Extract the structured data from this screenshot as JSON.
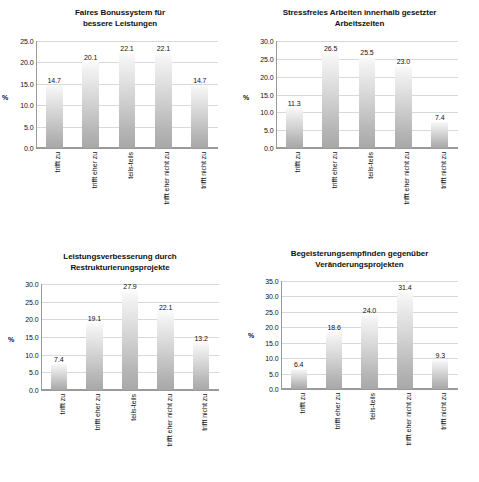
{
  "page": {
    "unit_label": "%"
  },
  "chart_data": [
    {
      "id": "faires-bonussystem",
      "type": "bar",
      "title": "Faires Bonussystem für bessere Leistungen",
      "title_lines": [
        "Faires Bonussystem für",
        "bessere Leistungen"
      ],
      "xlabel": "",
      "ylabel": "%",
      "ylim": [
        0.0,
        25.0
      ],
      "ytick_step": 5.0,
      "yticks": [
        "0.0",
        "5.0",
        "10.0",
        "15.0",
        "20.0",
        "25.0"
      ],
      "grid": true,
      "legend": "none",
      "categories": [
        "trifft zu",
        "trifft eher zu",
        "teils-teils",
        "trifft eher nicht zu",
        "trifft nicht zu"
      ],
      "values": [
        14.7,
        20.1,
        22.1,
        22.1,
        14.7
      ],
      "value_labels": [
        "14.7",
        "20.1",
        "22.1",
        "22.1",
        "14.7"
      ]
    },
    {
      "id": "stressfreies-arbeiten",
      "type": "bar",
      "title": "Stressfreies Arbeiten innerhalb gesetzter Arbeitszeiten",
      "title_lines": [
        "Stressfreies Arbeiten innerhalb gesetzter",
        "Arbeitszeiten"
      ],
      "xlabel": "",
      "ylabel": "%",
      "ylim": [
        0.0,
        30.0
      ],
      "ytick_step": 5.0,
      "yticks": [
        "0.0",
        "5.0",
        "10.0",
        "15.0",
        "20.0",
        "25.0",
        "30.0"
      ],
      "grid": true,
      "legend": "none",
      "categories": [
        "trifft zu",
        "trifft eher zu",
        "teils-teils",
        "trifft eher nicht zu",
        "trifft nicht zu"
      ],
      "values": [
        11.3,
        26.5,
        25.5,
        23.0,
        7.4
      ],
      "value_labels": [
        "11.3",
        "26.5",
        "25.5",
        "23.0",
        "7.4"
      ]
    },
    {
      "id": "leistungsverbesserung",
      "type": "bar",
      "title": "Leistungsverbesserung durch Restrukturierungsprojekte",
      "title_lines": [
        "Leistungsverbesserung durch",
        "Restrukturierungsprojekte"
      ],
      "xlabel": "",
      "ylabel": "%",
      "ylim": [
        0.0,
        30.0
      ],
      "ytick_step": 5.0,
      "yticks": [
        "0.0",
        "5.0",
        "10.0",
        "15.0",
        "20.0",
        "25.0",
        "30.0"
      ],
      "grid": true,
      "legend": "none",
      "categories": [
        "trifft zu",
        "trifft eher zu",
        "teils-teils",
        "trifft eher nicht zu",
        "trifft nicht zu"
      ],
      "values": [
        7.4,
        19.1,
        27.9,
        22.1,
        13.2
      ],
      "value_labels": [
        "7.4",
        "19.1",
        "27.9",
        "22.1",
        "13.2"
      ]
    },
    {
      "id": "begeisterungsempfinden",
      "type": "bar",
      "title": "Begeisterungsempfinden gegenüber Veränderungsprojekten",
      "title_lines": [
        "Begeisterungsempfinden gegenüber",
        "Veränderungsprojekten"
      ],
      "xlabel": "",
      "ylabel": "%",
      "ylim": [
        0.0,
        35.0
      ],
      "ytick_step": 5.0,
      "yticks": [
        "0.0",
        "5.0",
        "10.0",
        "15.0",
        "20.0",
        "25.0",
        "30.0",
        "35.0"
      ],
      "grid": true,
      "legend": "none",
      "categories": [
        "trifft zu",
        "trifft eher zu",
        "teils-teils",
        "trifft eher nicht zu",
        "trifft nicht zu"
      ],
      "values": [
        6.4,
        18.6,
        24.0,
        31.4,
        9.3
      ],
      "value_labels": [
        "6.4",
        "18.6",
        "24.0",
        "31.4",
        "9.3"
      ]
    }
  ],
  "style": {
    "bar_top_color": "#fbfbfb",
    "bar_bottom_color": "#a8a8a8",
    "gridline_color": "#d9d9d9",
    "axis_color": "#9a9a9a",
    "text_color": "#111111",
    "background": "#ffffff"
  }
}
